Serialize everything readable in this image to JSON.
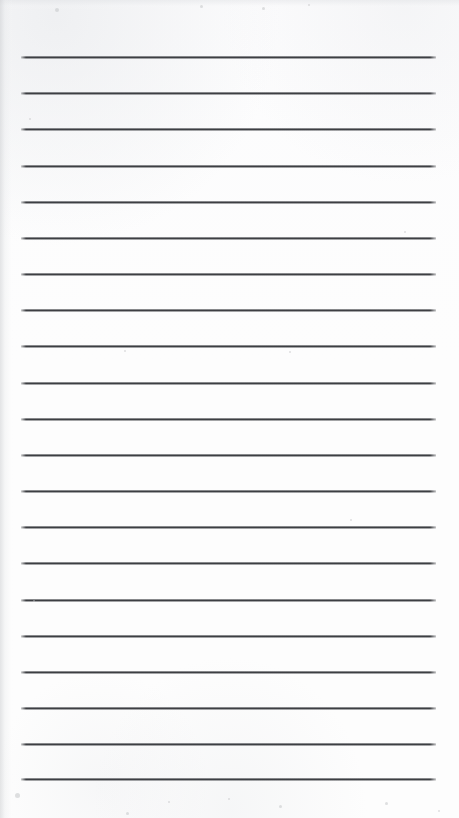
{
  "document": {
    "kind": "scanned-ruled-notebook-page",
    "title": "Blank ruled page",
    "page_width": 459,
    "page_height": 818,
    "background_color": "#fdfdfd",
    "text_content": "",
    "handwriting_present": false,
    "margin_rule_present": false,
    "header_text": "",
    "footer_text": "",
    "page_number": ""
  },
  "rules": {
    "count": 21,
    "color": "#3a3c40",
    "thickness_px": 2,
    "left_x": 21,
    "right_x": 436,
    "length_px": 415,
    "first_line_y": 57,
    "spacing_px": 36.1,
    "lines_y": [
      57,
      93,
      129,
      166,
      202,
      238,
      274,
      310,
      346,
      383,
      419,
      455,
      491,
      527,
      563,
      600,
      636,
      672,
      708,
      744,
      779
    ]
  },
  "artifacts": {
    "left_edge_shadow": true,
    "top_edge_shadow": true,
    "speckles": [
      {
        "x": 55,
        "y": 8,
        "size": 4
      },
      {
        "x": 200,
        "y": 5,
        "size": 3
      },
      {
        "x": 262,
        "y": 7,
        "size": 3
      },
      {
        "x": 308,
        "y": 4,
        "size": 2
      },
      {
        "x": 29,
        "y": 118,
        "size": 2
      },
      {
        "x": 404,
        "y": 231,
        "size": 2
      },
      {
        "x": 124,
        "y": 350,
        "size": 2
      },
      {
        "x": 289,
        "y": 351,
        "size": 2
      },
      {
        "x": 350,
        "y": 519,
        "size": 2
      },
      {
        "x": 33,
        "y": 600,
        "size": 2
      },
      {
        "x": 15,
        "y": 793,
        "size": 5
      },
      {
        "x": 126,
        "y": 812,
        "size": 3
      },
      {
        "x": 279,
        "y": 805,
        "size": 3
      },
      {
        "x": 385,
        "y": 802,
        "size": 3
      },
      {
        "x": 438,
        "y": 810,
        "size": 2
      },
      {
        "x": 168,
        "y": 801,
        "size": 2
      },
      {
        "x": 228,
        "y": 798,
        "size": 2
      }
    ]
  }
}
